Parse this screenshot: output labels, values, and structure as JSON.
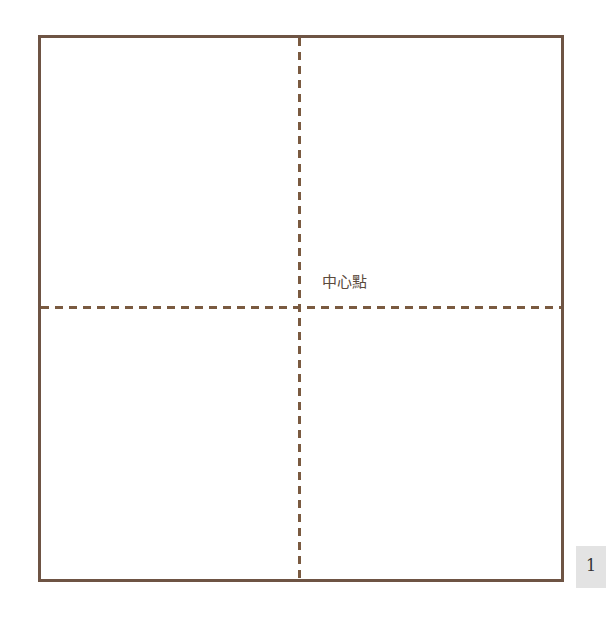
{
  "diagram": {
    "center_label": "中心點",
    "line_color": "#7a5a40",
    "frame_color": "#6e5444"
  },
  "page": {
    "number": "1"
  }
}
